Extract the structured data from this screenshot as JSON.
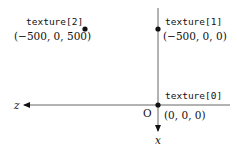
{
  "axes": {
    "horizontal_label": "z",
    "vertical_label": "x",
    "origin_label": "O"
  },
  "points": [
    {
      "name": "texture[0]",
      "coords": "(0, 0, 0)"
    },
    {
      "name": "texture[1]",
      "coords": "(−500, 0, 0)"
    },
    {
      "name": "texture[2]",
      "coords": "(−500, 0, 500)"
    }
  ],
  "colors": {
    "line": "#666666",
    "point": "#111111"
  }
}
